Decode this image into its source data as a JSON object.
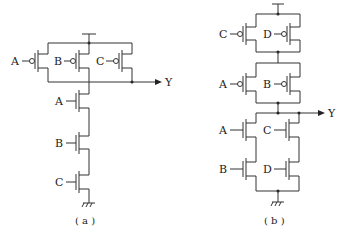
{
  "figure_a": {
    "caption": "( a )",
    "pmos_inputs": [
      "A",
      "B",
      "C"
    ],
    "nmos_inputs": [
      "A",
      "B",
      "C"
    ],
    "output": "Y"
  },
  "figure_b": {
    "caption": "( b )",
    "pmos_top_inputs": [
      "C",
      "D"
    ],
    "pmos_mid_inputs": [
      "A",
      "B"
    ],
    "nmos_left_inputs": [
      "A",
      "B"
    ],
    "nmos_right_inputs": [
      "C",
      "D"
    ],
    "output": "Y"
  }
}
